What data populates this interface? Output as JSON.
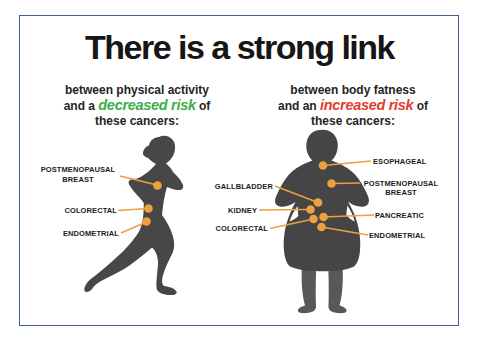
{
  "poster": {
    "title": "There is a strong link",
    "left": {
      "sub1": "between physical activity",
      "sub2a": "and a ",
      "risk": "decreased risk",
      "sub2b": " of",
      "sub3": "these cancers:",
      "risk_color": "#3aae49",
      "figure": "running-woman-silhouette",
      "labels": [
        "POSTMENOPAUSAL BREAST",
        "COLORECTAL",
        "ENDOMETRIAL"
      ]
    },
    "right": {
      "sub1": "between body fatness",
      "sub2a": "and an ",
      "risk": "increased risk",
      "sub2b": " of",
      "sub3": "these cancers:",
      "risk_color": "#e23b2e",
      "figure": "overweight-person-silhouette",
      "labels": [
        "ESOPHAGEAL",
        "POSTMENOPAUSAL BREAST",
        "GALLBLADDER",
        "KIDNEY",
        "PANCREATIC",
        "COLORECTAL",
        "ENDOMETRIAL"
      ]
    },
    "colors": {
      "marker": "#eba13e",
      "silhouette": "#474747",
      "frame_border": "#40608d",
      "text": "#1c1c1c"
    }
  }
}
